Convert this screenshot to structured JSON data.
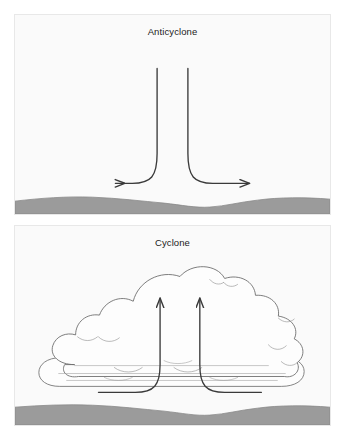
{
  "figure": {
    "background_color": "#ffffff",
    "width": 345,
    "height": 440
  },
  "panels": [
    {
      "id": "anticyclone",
      "title": "Anticyclone",
      "description": "Descending air diverging outward near the surface",
      "panel_fill": "#fafafa",
      "panel_border_color": "#e8e8e8",
      "ground": {
        "name": "ground-terrain",
        "fill_color": "#9b9b9b",
        "stroke_color": "#8a8a8a"
      },
      "flow": {
        "name": "subsidence-flow",
        "stroke_color": "#3a3a3a",
        "direction": "downward-then-outward",
        "arrow_count": 2,
        "arrow_directions": [
          "left",
          "right"
        ]
      }
    },
    {
      "id": "cyclone",
      "title": "Cyclone",
      "description": "Converging surface air rising into a towering cumulus cloud",
      "panel_fill": "#fafafa",
      "panel_border_color": "#e8e8e8",
      "ground": {
        "name": "ground-terrain",
        "fill_color": "#9b9b9b",
        "stroke_color": "#8a8a8a"
      },
      "cloud": {
        "name": "cumulus-cloud",
        "fill_color": "#fdfdfd",
        "stroke_color": "#6e6e6e"
      },
      "flow": {
        "name": "convergence-flow",
        "stroke_color": "#3a3a3a",
        "direction": "inward-then-upward",
        "arrow_count": 2,
        "arrow_directions": [
          "up",
          "up"
        ]
      }
    }
  ]
}
